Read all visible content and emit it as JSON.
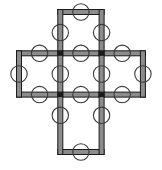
{
  "figure": {
    "title": "",
    "type": "lattice-diagram",
    "canvas": {
      "width": 162,
      "height": 170
    },
    "background_color": "#ffffff"
  },
  "style": {
    "edge_outline_color": "#1a1a1a",
    "edge_fill_color": "#8c8c8c",
    "edge_bar_thickness": 5.0,
    "edge_outline_width": 1.0,
    "circle_stroke_color": "#3a3a3a",
    "circle_stroke_width": 1.1,
    "circle_fill": "none",
    "circle_radius": 8.2,
    "junction_color": "#1a1a1a",
    "junction_size": 5.0
  },
  "grid": {
    "x_positions": [
      19,
      60.3,
      101.6,
      142.9
    ],
    "y_positions": [
      12,
      53.3,
      94.6,
      152
    ],
    "y_positions_actual": [
      12,
      53.3,
      94.6,
      111.3,
      152
    ],
    "columns": 4,
    "rows": 4,
    "cell_width": 41.3,
    "cell_height": 41.3,
    "removed_corner_cells": [
      {
        "row": 0,
        "col": 0
      },
      {
        "row": 0,
        "col": 2
      },
      {
        "row": 2,
        "col": 0
      },
      {
        "row": 2,
        "col": 2
      }
    ],
    "cell_count": 12,
    "shape_name": "plus"
  },
  "chart_data": {
    "type": "diagram",
    "title": "",
    "xlabel": "",
    "ylabel": "",
    "vertices": [
      {
        "id": "v0",
        "x": 60.3,
        "y": 12.0
      },
      {
        "id": "v1",
        "x": 101.6,
        "y": 12.0
      },
      {
        "id": "v2",
        "x": 60.3,
        "y": 53.3
      },
      {
        "id": "v3",
        "x": 101.6,
        "y": 53.3
      },
      {
        "id": "v4",
        "x": 19.0,
        "y": 53.3
      },
      {
        "id": "v5",
        "x": 142.9,
        "y": 53.3
      },
      {
        "id": "v6",
        "x": 19.0,
        "y": 94.6
      },
      {
        "id": "v7",
        "x": 60.3,
        "y": 94.6
      },
      {
        "id": "v8",
        "x": 101.6,
        "y": 94.6
      },
      {
        "id": "v9",
        "x": 142.9,
        "y": 94.6
      },
      {
        "id": "v10",
        "x": 60.3,
        "y": 111.3
      },
      {
        "id": "v11",
        "x": 101.6,
        "y": 111.3
      },
      {
        "id": "v12",
        "x": 60.3,
        "y": 152.0
      },
      {
        "id": "v13",
        "x": 101.6,
        "y": 152.0
      }
    ],
    "horizontal_edges": [
      {
        "id": "h0",
        "x1": 60.3,
        "x2": 101.6,
        "y": 12.0,
        "row": "top"
      },
      {
        "id": "h1",
        "x1": 19.0,
        "x2": 60.3,
        "y": 53.3,
        "row": "upper-mid"
      },
      {
        "id": "h2",
        "x1": 60.3,
        "x2": 101.6,
        "y": 53.3,
        "row": "upper-mid"
      },
      {
        "id": "h3",
        "x1": 101.6,
        "x2": 142.9,
        "y": 53.3,
        "row": "upper-mid"
      },
      {
        "id": "h4",
        "x1": 19.0,
        "x2": 60.3,
        "y": 94.6,
        "row": "lower-mid"
      },
      {
        "id": "h5",
        "x1": 60.3,
        "x2": 101.6,
        "y": 94.6,
        "row": "lower-mid"
      },
      {
        "id": "h6",
        "x1": 101.6,
        "x2": 142.9,
        "y": 94.6,
        "row": "lower-mid"
      },
      {
        "id": "h7",
        "x1": 60.3,
        "x2": 101.6,
        "y": 152.0,
        "row": "bottom"
      }
    ],
    "vertical_edges": [
      {
        "id": "e0",
        "x": 60.3,
        "y1": 12.0,
        "y2": 53.3,
        "col": "left-mid"
      },
      {
        "id": "e1",
        "x": 101.6,
        "y1": 12.0,
        "y2": 53.3,
        "col": "right-mid"
      },
      {
        "id": "e2",
        "x": 19.0,
        "y1": 53.3,
        "y2": 94.6,
        "col": "far-left"
      },
      {
        "id": "e3",
        "x": 60.3,
        "y1": 53.3,
        "y2": 94.6,
        "col": "left-mid"
      },
      {
        "id": "e4",
        "x": 101.6,
        "y1": 53.3,
        "y2": 94.6,
        "col": "right-mid"
      },
      {
        "id": "e5",
        "x": 142.9,
        "y1": 53.3,
        "y2": 94.6,
        "col": "far-right"
      },
      {
        "id": "e6",
        "x": 60.3,
        "y1": 94.6,
        "y2": 152.0,
        "col": "left-mid"
      },
      {
        "id": "e7",
        "x": 101.6,
        "y1": 94.6,
        "y2": 152.0,
        "col": "right-mid"
      }
    ],
    "circles": [
      {
        "id": "c0",
        "cx": 80.9,
        "cy": 12.0,
        "on_edge": "h0"
      },
      {
        "id": "c1",
        "cx": 60.3,
        "cy": 32.6,
        "on_edge": "e0"
      },
      {
        "id": "c2",
        "cx": 101.6,
        "cy": 32.6,
        "on_edge": "e1"
      },
      {
        "id": "c3",
        "cx": 39.6,
        "cy": 53.3,
        "on_edge": "h1"
      },
      {
        "id": "c4",
        "cx": 80.9,
        "cy": 53.3,
        "on_edge": "h2"
      },
      {
        "id": "c5",
        "cx": 122.2,
        "cy": 53.3,
        "on_edge": "h3"
      },
      {
        "id": "c6",
        "cx": 19.0,
        "cy": 74.0,
        "on_edge": "e2"
      },
      {
        "id": "c7",
        "cx": 60.3,
        "cy": 74.0,
        "on_edge": "e3"
      },
      {
        "id": "c8",
        "cx": 101.6,
        "cy": 74.0,
        "on_edge": "e4"
      },
      {
        "id": "c9",
        "cx": 142.9,
        "cy": 74.0,
        "on_edge": "e5"
      },
      {
        "id": "c10",
        "cx": 39.6,
        "cy": 94.6,
        "on_edge": "h4"
      },
      {
        "id": "c11",
        "cx": 80.9,
        "cy": 94.6,
        "on_edge": "h5"
      },
      {
        "id": "c12",
        "cx": 122.2,
        "cy": 94.6,
        "on_edge": "h6"
      },
      {
        "id": "c13",
        "cx": 60.3,
        "cy": 115.3,
        "on_edge": "e6"
      },
      {
        "id": "c14",
        "cx": 101.6,
        "cy": 115.3,
        "on_edge": "e7"
      },
      {
        "id": "c15",
        "cx": 80.9,
        "cy": 152.0,
        "on_edge": "h7"
      }
    ],
    "junctions": [
      {
        "id": "j0",
        "x": 60.3,
        "y": 53.3
      },
      {
        "id": "j1",
        "x": 101.6,
        "y": 53.3
      },
      {
        "id": "j2",
        "x": 60.3,
        "y": 94.6
      },
      {
        "id": "j3",
        "x": 101.6,
        "y": 94.6
      }
    ],
    "counts": {
      "horizontal_edges": 8,
      "vertical_edges": 8,
      "circles": 16,
      "junctions": 4
    }
  }
}
